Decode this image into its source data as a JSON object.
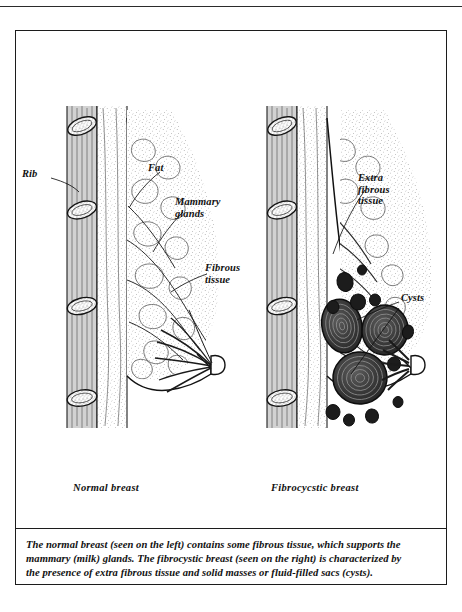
{
  "page": {
    "background_color": "#ffffff",
    "ink_color": "#111111",
    "frame_color": "#1c1c1c"
  },
  "figures": [
    {
      "id": "normal-breast",
      "caption": "Normal breast",
      "labels": [
        {
          "name": "rib",
          "text": "Rib"
        },
        {
          "name": "fat",
          "text": "Fat"
        },
        {
          "name": "mammary-glands",
          "text": "Mammary\nglands"
        },
        {
          "name": "fibrous-tissue",
          "text": "Fibrous\ntissue"
        }
      ]
    },
    {
      "id": "fibrocystic-breast",
      "caption": "Fibrocycstic breast",
      "labels": [
        {
          "name": "extra-fibrous-tissue",
          "text": "Extra\nfibrous\ntissue"
        },
        {
          "name": "cysts",
          "text": "Cysts"
        }
      ]
    }
  ],
  "caption": {
    "line1": "The normal breast (seen on the left) contains some fibrous tissue, which supports the",
    "line2": "mammary (milk) glands. The fibrocystic breast (seen on the right) is characterized by",
    "line3": "the presence of extra fibrous tissue and solid masses or fluid-filled sacs (cysts)."
  }
}
